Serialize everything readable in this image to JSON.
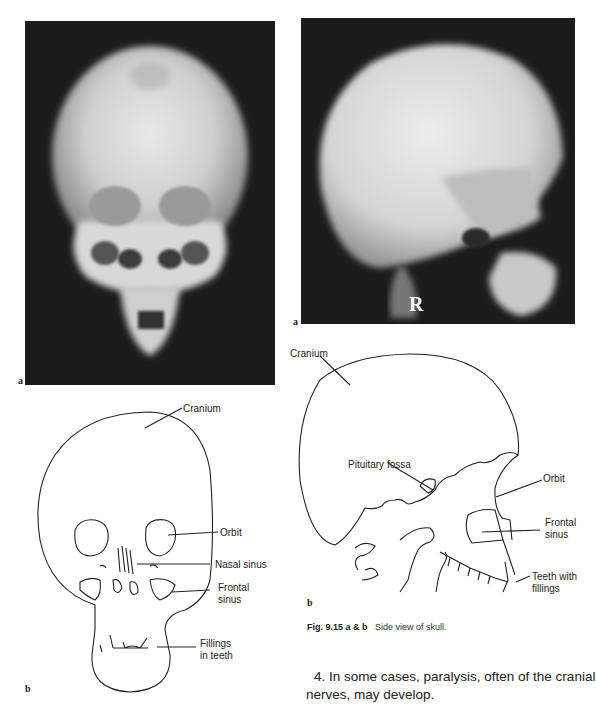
{
  "figures": {
    "front_xray": {
      "panel_letter": "a",
      "description": "Frontal skull radiograph"
    },
    "side_xray": {
      "panel_letter": "a",
      "marker": "R",
      "description": "Lateral skull radiograph"
    },
    "front_diagram": {
      "panel_letter": "b",
      "labels": {
        "cranium": "Cranium",
        "orbit": "Orbit",
        "nasal_sinus": "Nasal sinus",
        "frontal_sinus_1": "Frontal",
        "frontal_sinus_2": "sinus",
        "fillings_1": "Fillings",
        "fillings_2": "in teeth"
      }
    },
    "side_diagram": {
      "panel_letter": "b",
      "labels": {
        "cranium": "Cranium",
        "pituitary": "Pituitary fossa",
        "orbit": "Orbit",
        "frontal_sinus_1": "Frontal",
        "frontal_sinus_2": "sinus",
        "teeth_1": "Teeth with",
        "teeth_2": "fillings"
      }
    }
  },
  "caption": {
    "fig_number": "Fig. 9.15 a & b",
    "text": "Side view of skull."
  },
  "body": {
    "line1": "4. In some cases, paralysis, often of the cranial",
    "line2": "nerves, may develop."
  }
}
